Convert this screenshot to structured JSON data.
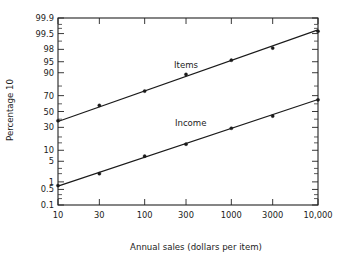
{
  "chart_data": {
    "type": "line",
    "title": "",
    "subtitle": "",
    "xlabel": "Annual sales (dollars per item)",
    "ylabel": "Percentage 10",
    "x_scale": "log",
    "y_scale": "probability",
    "grid": false,
    "legend_position": "inline-annotation",
    "x_ticks": [
      "10",
      "30",
      "100",
      "300",
      "1000",
      "3000",
      "10,000"
    ],
    "x_tick_values": [
      10,
      30,
      100,
      300,
      1000,
      3000,
      10000
    ],
    "y_ticks": [
      "99.9",
      "99.5",
      "98",
      "95",
      "90",
      "70",
      "50",
      "30",
      "10",
      "5",
      "1",
      "0.5",
      "0.1"
    ],
    "y_tick_values": [
      99.9,
      99.5,
      98,
      95,
      90,
      70,
      50,
      30,
      10,
      5,
      1,
      0.5,
      0.1
    ],
    "y_minor_tick_values": [
      99.8,
      99,
      99.7,
      80,
      60,
      40,
      20,
      15,
      3,
      2,
      0.2,
      0.3
    ],
    "xlim": [
      10,
      10000
    ],
    "ylim": [
      0.1,
      99.9
    ],
    "x": [
      10,
      30,
      100,
      300,
      1000,
      3000,
      10000
    ],
    "series": [
      {
        "name": "Items",
        "label": "Items",
        "color": "#1a1a1a",
        "marker": "circle",
        "values": [
          38,
          58,
          75,
          89,
          95.5,
          98.2,
          99.6
        ],
        "fit_endpoints": [
          [
            10,
            37
          ],
          [
            10000,
            99.65
          ]
        ],
        "annotation": {
          "text": "Items",
          "x": 300,
          "y": 92.5
        }
      },
      {
        "name": "Income",
        "label": "Income",
        "color": "#1a1a1a",
        "marker": "circle",
        "values": [
          0.72,
          2.0,
          7.0,
          14.0,
          29.0,
          44.0,
          65.0
        ],
        "fit_endpoints": [
          [
            10,
            0.68
          ],
          [
            10000,
            65.5
          ]
        ],
        "annotation": {
          "text": "Income",
          "x": 340,
          "y": 31.5
        }
      }
    ]
  }
}
